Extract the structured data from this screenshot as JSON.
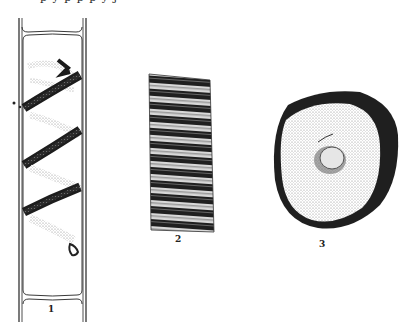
{
  "page": {
    "top_text_fragment": "p  y  p  p  p  y  j",
    "panels": [
      {
        "id": 1,
        "label": "1",
        "description": "cylindrical cell with spiral chloroplast band"
      },
      {
        "id": 2,
        "label": "2",
        "description": "transversely striated band segment"
      },
      {
        "id": 3,
        "label": "3",
        "description": "rounded cell with dark rim and central nucleus"
      }
    ]
  },
  "colors": {
    "ink": "#1a1a1a",
    "stipple_light": "#bdbdbd",
    "background": "#ffffff"
  }
}
